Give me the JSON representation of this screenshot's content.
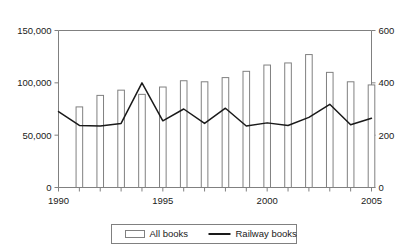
{
  "chart_data": {
    "type": "bar",
    "title": "",
    "subtitle": "",
    "xlabel": "",
    "ylabel": "",
    "x": [
      1990,
      1991,
      1992,
      1993,
      1994,
      1995,
      1996,
      1997,
      1998,
      1999,
      2000,
      2001,
      2002,
      2003,
      2004,
      2005
    ],
    "categories": [
      "1990",
      "1991",
      "1992",
      "1993",
      "1994",
      "1995",
      "1996",
      "1997",
      "1998",
      "1999",
      "2000",
      "2001",
      "2002",
      "2003",
      "2004",
      "2005"
    ],
    "xtick_labels": [
      "1990",
      "1995",
      "2000",
      "2005"
    ],
    "xtick_values": [
      1990,
      1995,
      2000,
      2005
    ],
    "xlim": [
      1990,
      2005
    ],
    "grid": false,
    "legend_position": "bottom",
    "series": [
      {
        "name": "All books",
        "type": "bar",
        "axis": "left",
        "values": [
          null,
          77000,
          88000,
          93000,
          89000,
          96000,
          102000,
          101000,
          105000,
          111000,
          117000,
          119000,
          127000,
          110000,
          101000,
          98000
        ],
        "fill": "#ffffff",
        "stroke": "#808080"
      },
      {
        "name": "Railway books",
        "type": "line",
        "axis": "right",
        "values": [
          290,
          237,
          235,
          245,
          400,
          255,
          300,
          245,
          303,
          235,
          247,
          237,
          268,
          318,
          240,
          265
        ],
        "stroke": "#1a1a1a"
      }
    ],
    "left_axis": {
      "label": "",
      "ylim": [
        0,
        150000
      ],
      "ticks": [
        0,
        50000,
        100000,
        150000
      ],
      "tick_labels": [
        "0",
        "50,000",
        "100,000",
        "150,000"
      ]
    },
    "right_axis": {
      "label": "",
      "ylim": [
        0,
        600
      ],
      "ticks": [
        0,
        200,
        400,
        600
      ],
      "tick_labels": [
        "0",
        "200",
        "400",
        "600"
      ]
    }
  },
  "legend": {
    "items": [
      {
        "label": "All books",
        "marker": "bar-swatch-icon"
      },
      {
        "label": "Railway books",
        "marker": "line-swatch-icon"
      }
    ]
  },
  "colors": {
    "bar_fill": "#ffffff",
    "bar_stroke": "#808080",
    "line_stroke": "#1a1a1a",
    "axis": "#808080",
    "text": "#1a1a1a",
    "background": "#ffffff"
  }
}
